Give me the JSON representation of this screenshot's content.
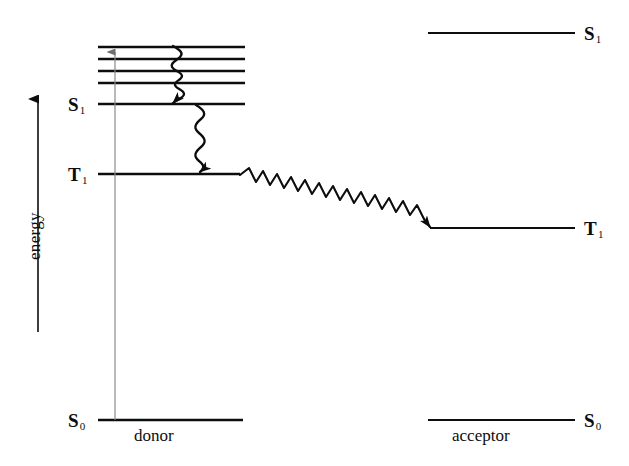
{
  "figure": {
    "kind": "jablonski-energy-transfer-diagram",
    "background_color": "#ffffff",
    "line_color": "#0d0d0d",
    "thin_line_color": "#8a8a8a",
    "width": 629,
    "height": 466
  },
  "axis": {
    "energy_label": "energy",
    "direction": "up"
  },
  "donor": {
    "group_label": "donor",
    "states": {
      "s0_label": "S",
      "s0_sub": "0",
      "s1_label": "S",
      "s1_sub": "1",
      "t1_label": "T",
      "t1_sub": "1"
    },
    "vibrational_levels_count": 4
  },
  "acceptor": {
    "group_label": "acceptor",
    "states": {
      "s0_label": "S",
      "s0_sub": "0",
      "s1_label": "S",
      "s1_sub": "1",
      "t1_label": "T",
      "t1_sub": "1"
    }
  },
  "processes": {
    "absorption": "vertical-excitation-arrow",
    "internal_conversion": "wavy-cascade-donor-vibrational-to-s1",
    "intersystem_crossing": "wavy-donor-s1-to-t1",
    "triplet_energy_transfer": "wavy-donor-t1-to-acceptor-t1"
  },
  "geometry": {
    "donor_level_x1": 98,
    "donor_level_x2": 245,
    "acceptor_level_x1": 428,
    "acceptor_level_x2": 575,
    "donor_vib_y": [
      47,
      59,
      71,
      83
    ],
    "donor_s1_y": 104,
    "donor_t1_y": 174,
    "donor_s0_y": 420,
    "acceptor_s1_y": 33,
    "acceptor_t1_y": 228,
    "acceptor_s0_y": 420,
    "excitation_x": 115,
    "axis_x": 38,
    "axis_top_y": 95,
    "axis_bottom_y": 332
  }
}
